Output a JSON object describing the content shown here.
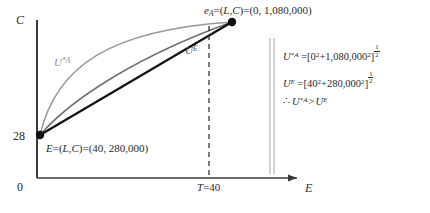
{
  "figure": {
    "axes": {
      "y_axis_label": "C",
      "x_axis_label": "E",
      "origin_label": "0",
      "y_tick_label": "28",
      "x_tick_label_prefix": "T",
      "x_tick_label_eq": "=40",
      "x_tick_value": 40
    },
    "points": [
      {
        "id": "point-ea",
        "name": "e",
        "subscript": "A",
        "equals_1": "=(",
        "vars": "L,C",
        "equals_2": ")=(",
        "coords": "0, 1,080,000",
        "close": ")",
        "L": 0,
        "C": 1080000
      },
      {
        "id": "point-e",
        "name": "E",
        "subscript": "",
        "equals_1": "=(",
        "vars": "L,C",
        "equals_2": ")=(",
        "coords": "40, 280,000",
        "close": ")",
        "L": 40,
        "C": 280000
      }
    ],
    "curves": [
      {
        "id": "curve-ua",
        "label_base": "U",
        "label_sup": "*A",
        "color": "#9a9a9a"
      },
      {
        "id": "curve-ue",
        "label_base": "U",
        "label_sup": "E",
        "color": "#6e6e6e"
      }
    ],
    "equations": [
      {
        "id": "eq-ua",
        "lhs_base": "U",
        "lhs_sup": "*A",
        "eq": " =[",
        "t1_base": "0",
        "t1_sup": "2",
        "plus": "+",
        "t2_base": "1,080,000",
        "t2_sup": "2",
        "close": "]",
        "exp_num": "1",
        "exp_den": "2"
      },
      {
        "id": "eq-ue",
        "lhs_base": "U",
        "lhs_sup": "E",
        "eq": " =[",
        "t1_base": "40",
        "t1_sup": "2",
        "plus": "+",
        "t2_base": "280,000",
        "t2_sup": "2",
        "close": "]",
        "exp_num": "1",
        "exp_den": "2"
      }
    ],
    "conclusion": {
      "id": "eq-conclusion",
      "therefore": "∴",
      "lhs_base": "U",
      "lhs_sup": "*A",
      "relation": ">",
      "rhs_base": "U",
      "rhs_sup": "E"
    },
    "colors": {
      "axis": "#3a3a3a",
      "budget_line": "#111111",
      "curve_a": "#9a9a9a",
      "curve_e": "#6e6e6e",
      "dashed": "#222222",
      "separator": "#b0b0b0",
      "text": "#2b2b2b",
      "background": "#ffffff"
    }
  }
}
